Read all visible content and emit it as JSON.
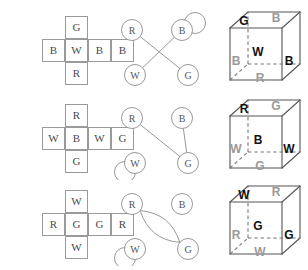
{
  "figure": {
    "colors": {
      "net_border": "#9a9a9a",
      "net_text": "#4a4a4a",
      "graph_stroke": "#8c8c8c",
      "graph_text": "#555555",
      "cube_edge": "#555555",
      "cube_hidden_edge": "#777777",
      "label_front": "#111111",
      "label_back": "#9a9a9a"
    },
    "rows": [
      {
        "id": "row-1",
        "net": {
          "name": "cube-net-1",
          "top": "G",
          "middle": [
            "B",
            "W",
            "B",
            "B"
          ],
          "bottom": "R"
        },
        "graph": {
          "name": "adjacency-graph-1",
          "nodes": [
            {
              "label": "R",
              "x": 20,
              "y": 26
            },
            {
              "label": "B",
              "x": 70,
              "y": 26
            },
            {
              "label": "W",
              "x": 23,
              "y": 71
            },
            {
              "label": "G",
              "x": 76,
              "y": 71
            }
          ],
          "edges": [
            {
              "from": "R",
              "to": "G"
            },
            {
              "from": "B",
              "to": "W"
            }
          ],
          "loops": [
            {
              "at": "B",
              "dx": 13,
              "dy": -7
            }
          ]
        },
        "cube": {
          "name": "folded-cube-1",
          "top": "G",
          "back_top": "B",
          "front": "W",
          "left": "B",
          "right": "B",
          "bottom": "R"
        }
      },
      {
        "id": "row-2",
        "net": {
          "name": "cube-net-2",
          "top": "R",
          "middle": [
            "W",
            "B",
            "W",
            "G"
          ],
          "bottom": "G"
        },
        "graph": {
          "name": "adjacency-graph-2",
          "nodes": [
            {
              "label": "R",
              "x": 20,
              "y": 26
            },
            {
              "label": "B",
              "x": 70,
              "y": 26
            },
            {
              "label": "W",
              "x": 23,
              "y": 71
            },
            {
              "label": "G",
              "x": 76,
              "y": 71
            }
          ],
          "edges": [
            {
              "from": "R",
              "to": "G"
            },
            {
              "from": "B",
              "to": "G"
            }
          ],
          "loops": [
            {
              "at": "W",
              "dx": -10,
              "dy": 9
            }
          ]
        },
        "cube": {
          "name": "folded-cube-2",
          "top": "R",
          "back_top": "G",
          "front": "B",
          "left": "W",
          "right": "W",
          "bottom": "G"
        }
      },
      {
        "id": "row-3",
        "net": {
          "name": "cube-net-3",
          "top": "W",
          "middle": [
            "R",
            "G",
            "G",
            "R"
          ],
          "bottom": "W"
        },
        "graph": {
          "name": "adjacency-graph-3",
          "nodes": [
            {
              "label": "R",
              "x": 20,
              "y": 26
            },
            {
              "label": "B",
              "x": 70,
              "y": 26
            },
            {
              "label": "W",
              "x": 23,
              "y": 71
            },
            {
              "label": "G",
              "x": 76,
              "y": 71
            }
          ],
          "edges": [
            {
              "from": "R",
              "to": "G",
              "curve": 1
            },
            {
              "from": "R",
              "to": "G",
              "curve": -1
            }
          ],
          "loops": [
            {
              "at": "W",
              "dx": -10,
              "dy": 9
            }
          ]
        },
        "cube": {
          "name": "folded-cube-3",
          "top": "W",
          "back_top": "R",
          "front": "G",
          "left": "R",
          "right": "G",
          "bottom": "W"
        }
      }
    ]
  }
}
